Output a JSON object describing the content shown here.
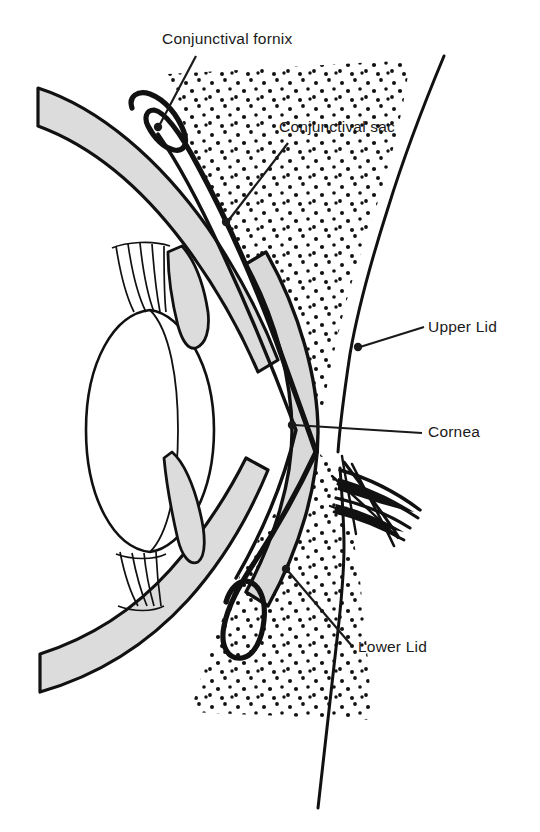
{
  "figure": {
    "background_color": "#ffffff",
    "width": 540,
    "height": 832
  },
  "colors": {
    "ink": "#1a1a1a",
    "outline": "#111111",
    "sclera_fill": "#dcdcdc",
    "cornea_fill": "#d9d9d9",
    "lens_fill": "#ffffff",
    "sac_fill": "#ffffff",
    "stipple": "#111111",
    "leader_line": "#1a1a1a"
  },
  "labels": [
    {
      "id": "conjunctival-fornix",
      "text": "Conjunctival fornix",
      "x": 162,
      "y": 44,
      "anchor": "start",
      "leader": {
        "x1": 196,
        "y1": 56,
        "x2": 159,
        "y2": 126
      },
      "dot": {
        "cx": 158,
        "cy": 127,
        "r": 4.2
      }
    },
    {
      "id": "conjunctival-sac",
      "text": "Conjunctival sac",
      "x": 279,
      "y": 132,
      "anchor": "start",
      "leader": {
        "x1": 288,
        "y1": 143,
        "x2": 228,
        "y2": 221
      },
      "dot": {
        "cx": 226,
        "cy": 222,
        "r": 4.2
      }
    },
    {
      "id": "upper-lid",
      "text": "Upper Lid",
      "x": 428,
      "y": 332,
      "anchor": "start",
      "leader": {
        "x1": 424,
        "y1": 327,
        "x2": 360,
        "y2": 347
      },
      "dot": {
        "cx": 358,
        "cy": 347,
        "r": 4.2
      }
    },
    {
      "id": "cornea",
      "text": "Cornea",
      "x": 428,
      "y": 437,
      "anchor": "start",
      "leader": {
        "x1": 422,
        "y1": 433,
        "x2": 294,
        "y2": 425
      },
      "dot": {
        "cx": 292,
        "cy": 425,
        "r": 4.2
      }
    },
    {
      "id": "lower-lid",
      "text": "Lower Lid",
      "x": 358,
      "y": 652,
      "anchor": "start",
      "leader": {
        "x1": 352,
        "y1": 646,
        "x2": 288,
        "y2": 571
      },
      "dot": {
        "cx": 286,
        "cy": 569,
        "r": 4.2
      }
    }
  ],
  "structures": [
    {
      "id": "sclera-band-upper",
      "name": "Sclera and uveal coat, upper arm",
      "fill": "#dcdcdc"
    },
    {
      "id": "sclera-band-lower",
      "name": "Sclera and uveal coat, lower arm",
      "fill": "#dcdcdc"
    },
    {
      "id": "cornea-band",
      "name": "Cornea",
      "fill": "#d9d9d9"
    },
    {
      "id": "lens",
      "name": "Lens",
      "fill": "#ffffff"
    },
    {
      "id": "iris-upper",
      "name": "Upper iris leaf",
      "fill": "#dcdcdc"
    },
    {
      "id": "iris-lower",
      "name": "Lower iris leaf",
      "fill": "#dcdcdc"
    },
    {
      "id": "zonules-upper",
      "name": "Upper ciliary zonule fibres",
      "fill": "none"
    },
    {
      "id": "zonules-lower",
      "name": "Lower ciliary zonule fibres",
      "fill": "none"
    },
    {
      "id": "conjunctiva-line",
      "name": "Conjunctival membrane with upper and lower fornices",
      "fill": "none"
    },
    {
      "id": "eyelid-tissue-upper",
      "name": "Upper eyelid stippled tissue",
      "fill": "stipple"
    },
    {
      "id": "eyelid-tissue-lower",
      "name": "Lower eyelid stippled tissue",
      "fill": "stipple"
    },
    {
      "id": "skin-contour",
      "name": "Facial skin surface contour",
      "fill": "none"
    },
    {
      "id": "eyelashes",
      "name": "Eyelashes at palpebral fissure",
      "fill": "none"
    }
  ]
}
